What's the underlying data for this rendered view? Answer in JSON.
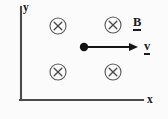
{
  "figure": {
    "background_color": "#fbfbfb",
    "ink_color": "#1b1b1b",
    "width": 168,
    "height": 119
  },
  "axes": {
    "y_axis_label": "y",
    "x_axis_label": "x",
    "origin": {
      "x": 21,
      "y": 100
    },
    "y_axis_top": {
      "x": 21,
      "y": 7
    },
    "x_axis_right": {
      "x": 143,
      "y": 100
    },
    "stroke_color": "#4a4a4a"
  },
  "field": {
    "symbol": "cross-in-circle",
    "direction": "into-the-page",
    "label": "B",
    "label_position": {
      "x": 133,
      "y": 16
    },
    "circle_radius": 8,
    "markers": [
      {
        "cx": 58,
        "cy": 26
      },
      {
        "cx": 113,
        "cy": 25
      },
      {
        "cx": 58,
        "cy": 72
      },
      {
        "cx": 113,
        "cy": 72
      }
    ],
    "stroke_color": "#5a5a5a"
  },
  "velocity": {
    "label": "v",
    "label_position": {
      "x": 144,
      "y": 40
    },
    "direction": "right",
    "arrow_start": {
      "x": 86,
      "y": 47
    },
    "arrow_end": {
      "x": 138,
      "y": 47
    },
    "color": "#151515"
  },
  "particle": {
    "shape": "filled-dot",
    "center": {
      "x": 84,
      "y": 47
    },
    "radius": 4.2,
    "color": "#121212"
  }
}
